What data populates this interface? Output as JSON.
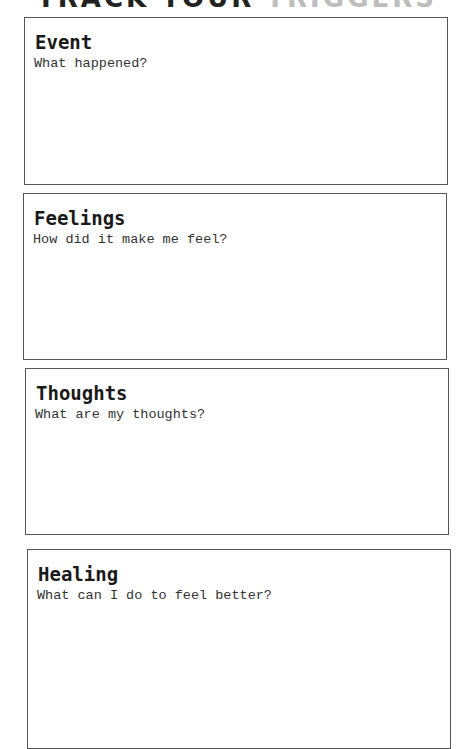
{
  "header": {
    "title_part1": "TRACK YOUR ",
    "title_part2": "TRIGGERS"
  },
  "sections": [
    {
      "heading": "Event",
      "prompt": "What happened?"
    },
    {
      "heading": "Feelings",
      "prompt": "How did it make me feel?"
    },
    {
      "heading": "Thoughts",
      "prompt": "What are my thoughts?"
    },
    {
      "heading": "Healing",
      "prompt": "What can I do to feel better?"
    }
  ],
  "colors": {
    "border": "#555555",
    "heading_text": "#1a1a1a",
    "prompt_text": "#333333",
    "title_dim": "#bdbdbd"
  }
}
